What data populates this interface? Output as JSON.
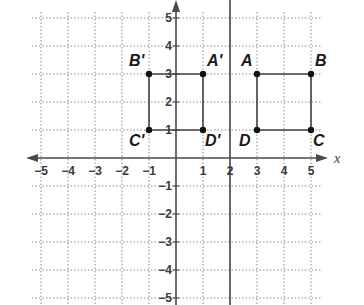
{
  "diagram": {
    "x_axis": {
      "label": "x",
      "min": -5,
      "max": 5,
      "ticks": [
        -5,
        -4,
        -3,
        -2,
        -1,
        1,
        2,
        3,
        4,
        5
      ]
    },
    "y_axis": {
      "label": "",
      "min": -5,
      "max": 5,
      "ticks": [
        5,
        4,
        3,
        2,
        1,
        -1,
        -2,
        -3,
        -4,
        -5
      ]
    },
    "tick_labels": {
      "x": [
        "−5",
        "−4",
        "−3",
        "−2",
        "−1",
        "1",
        "2",
        "3",
        "4",
        "5"
      ],
      "y": [
        "5",
        "4",
        "3",
        "2",
        "1",
        "−1",
        "−2",
        "−3",
        "−4",
        "−5"
      ]
    },
    "reflection_line": {
      "equation": "x = 2",
      "x": 2
    },
    "original": {
      "name": "ABCD",
      "points": [
        {
          "label": "A",
          "x": 3,
          "y": 3
        },
        {
          "label": "B",
          "x": 5,
          "y": 3
        },
        {
          "label": "C",
          "x": 5,
          "y": 1
        },
        {
          "label": "D",
          "x": 3,
          "y": 1
        }
      ]
    },
    "image": {
      "name": "A'B'C'D'",
      "points": [
        {
          "label": "A'",
          "x": 1,
          "y": 3
        },
        {
          "label": "B'",
          "x": -1,
          "y": 3
        },
        {
          "label": "C'",
          "x": -1,
          "y": 1
        },
        {
          "label": "D'",
          "x": 1,
          "y": 1
        }
      ]
    },
    "colors": {
      "grid": "#8a8a8a",
      "axis": "#4a4a4a",
      "shape": "#444444",
      "point": "#111111"
    }
  }
}
